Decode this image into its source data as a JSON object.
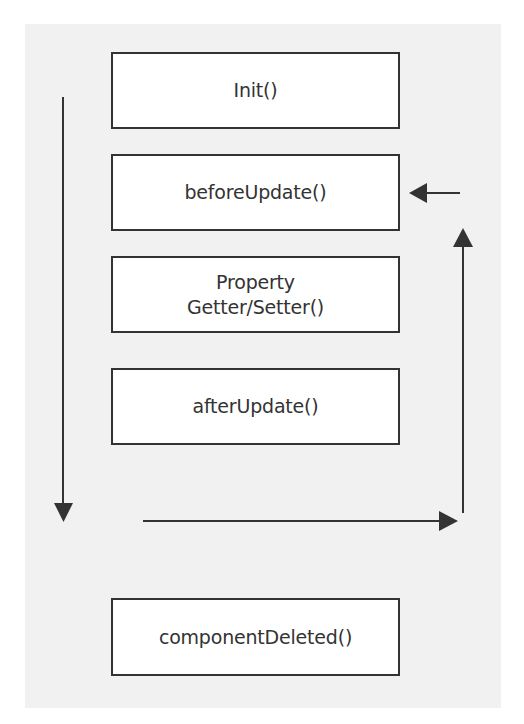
{
  "diagram": {
    "type": "lifecycle-flow",
    "nodes": [
      {
        "id": "init",
        "lines": [
          "Init()"
        ]
      },
      {
        "id": "before-update",
        "lines": [
          "beforeUpdate()"
        ]
      },
      {
        "id": "property-getter-setter",
        "lines": [
          "Property",
          "Getter/Setter()"
        ]
      },
      {
        "id": "after-update",
        "lines": [
          "afterUpdate()"
        ]
      },
      {
        "id": "component-deleted",
        "lines": [
          "componentDeleted()"
        ]
      }
    ],
    "edges": [
      {
        "from": "init",
        "to": "component-deleted",
        "direction": "down",
        "label": ""
      },
      {
        "from": "after-update",
        "to": "before-update",
        "direction": "loop-right-up-left",
        "label": ""
      }
    ],
    "colors": {
      "background": "#f1f1f1",
      "box_fill": "#ffffff",
      "stroke": "#333333",
      "text": "#333333"
    }
  }
}
